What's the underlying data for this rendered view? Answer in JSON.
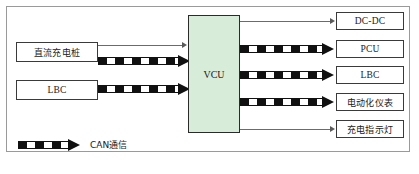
{
  "figure": {
    "title": "",
    "colors": {
      "controller_fill": "#d7ecd9",
      "node_border": "#3a3a3a",
      "frame_border": "#9a9a9a",
      "bus_line": "#111111",
      "thin_line": "#6b6b6b",
      "background": "#ffffff"
    }
  },
  "controller": {
    "label": "VCU"
  },
  "inputs": [
    {
      "label": "直流充电桩",
      "script": "cn"
    },
    {
      "label": "LBC",
      "script": "en"
    }
  ],
  "outputs": [
    {
      "label": "DC-DC",
      "script": "en"
    },
    {
      "label": "PCU",
      "script": "en"
    },
    {
      "label": "LBC",
      "script": "en"
    },
    {
      "label": "电动化仪表",
      "script": "cn"
    },
    {
      "label": "充电指示灯",
      "script": "cn"
    }
  ],
  "connections": {
    "left": [
      {
        "from": "直流充电桩",
        "to": "VCU",
        "style": "thin"
      },
      {
        "from": "直流充电桩",
        "to": "VCU",
        "style": "can-bus"
      },
      {
        "from": "LBC",
        "to": "VCU",
        "style": "can-bus"
      }
    ],
    "right": [
      {
        "from": "VCU",
        "to": "DC-DC",
        "style": "thin"
      },
      {
        "from": "VCU",
        "to": "PCU",
        "style": "can-bus"
      },
      {
        "from": "VCU",
        "to": "LBC",
        "style": "can-bus"
      },
      {
        "from": "VCU",
        "to": "电动化仪表",
        "style": "can-bus"
      },
      {
        "from": "VCU",
        "to": "充电指示灯",
        "style": "thin"
      }
    ]
  },
  "legend": {
    "label": "CAN通信",
    "style": "can-bus"
  }
}
